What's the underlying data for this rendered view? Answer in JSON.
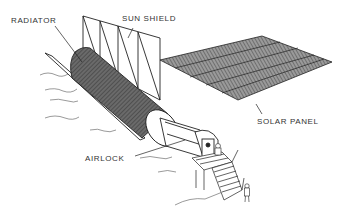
{
  "diagram": {
    "colors": {
      "line": "#222222",
      "shade": "#5a5a5a",
      "panel": "#8a8a8a",
      "background": "#ffffff"
    },
    "labels": {
      "radiator": "RADIATOR",
      "sun_shield": "SUN SHIELD",
      "solar_panel": "SOLAR PANEL",
      "airlock": "AIRLOCK"
    }
  }
}
